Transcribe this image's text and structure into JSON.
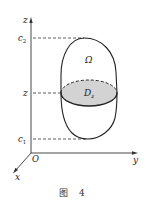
{
  "figure": {
    "caption": "图 4",
    "axes": {
      "z_label": "z",
      "y_label": "y",
      "x_label": "x",
      "origin_label": "O"
    },
    "levels": {
      "upper": {
        "name": "c",
        "sub": "2"
      },
      "middle": {
        "name": "z"
      },
      "lower": {
        "name": "c",
        "sub": "1"
      }
    },
    "region_label": "Ω",
    "cross_section": {
      "name": "D",
      "sub": "z",
      "fill": "#d3d3d3"
    },
    "colors": {
      "stroke": "#222222",
      "cross_section_fill": "#d3d3d3"
    }
  }
}
